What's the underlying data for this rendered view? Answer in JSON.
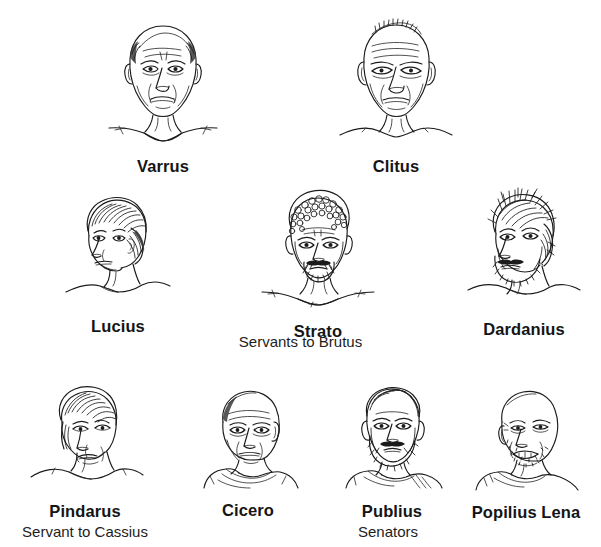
{
  "page": {
    "background_color": "#ffffff",
    "ink_color": "#1b1b1b",
    "width": 601,
    "height": 547
  },
  "rows": [
    {
      "row_index": 0,
      "characters": [
        {
          "name": "Varrus",
          "portrait": "varrus-portrait",
          "pose": "front-facing bald older man"
        },
        {
          "name": "Clitus",
          "portrait": "clitus-portrait",
          "pose": "front-facing balding older man"
        }
      ]
    },
    {
      "row_index": 1,
      "characters": [
        {
          "name": "Lucius",
          "portrait": "lucius-portrait",
          "pose": "three-quarter young man with bowl haircut"
        },
        {
          "name": "Strato",
          "portrait": "strato-portrait",
          "pose": "front-facing curly hair bearded man"
        },
        {
          "name": "Dardanius",
          "portrait": "dardanius-portrait",
          "pose": "three-quarter shaggy hair bearded man"
        }
      ],
      "group_label": "Servants to Brutus"
    },
    {
      "row_index": 2,
      "characters": [
        {
          "name": "Pindarus",
          "portrait": "pindarus-portrait",
          "pose": "three-quarter young man with fringe"
        },
        {
          "name": "Cicero",
          "portrait": "cicero-portrait",
          "pose": "three-quarter bald elder in toga"
        },
        {
          "name": "Publius",
          "portrait": "publius-portrait",
          "pose": "front-facing bearded man in toga"
        },
        {
          "name": "Popilius Lena",
          "portrait": "popilius-lena-portrait",
          "pose": "three-quarter smiling bald bearded man"
        }
      ],
      "group_labels": [
        {
          "text": "Servant to Cassius",
          "under": "Pindarus"
        },
        {
          "text": "Senators",
          "under": "Publius"
        }
      ]
    }
  ],
  "labels": {
    "varrus": "Varrus",
    "clitus": "Clitus",
    "lucius": "Lucius",
    "strato": "Strato",
    "dardanius": "Dardanius",
    "pindarus": "Pindarus",
    "cicero": "Cicero",
    "publius": "Publius",
    "popilius_lena": "Popilius Lena",
    "servants_to_brutus": "Servants to Brutus",
    "servant_to_cassius": "Servant to Cassius",
    "senators": "Senators"
  }
}
